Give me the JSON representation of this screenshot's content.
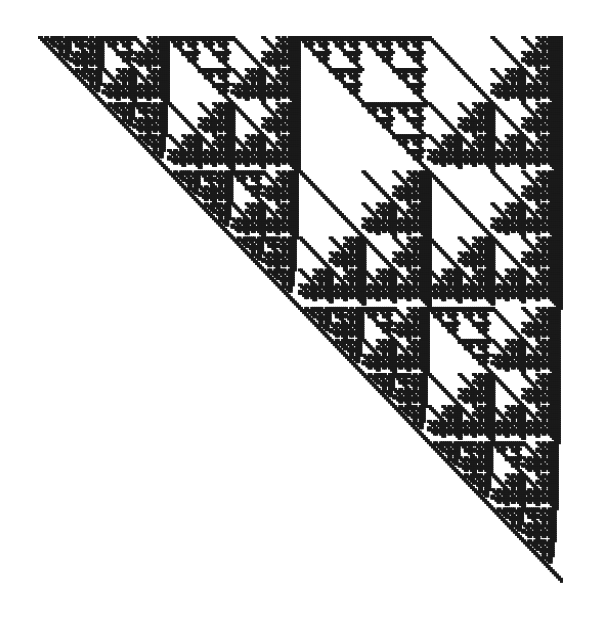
{
  "image": {
    "title": "Sierpinski-type recursive fractal",
    "width": 600,
    "height": 626,
    "background_color": "#ffffff",
    "ink_color": "#1a1a1a"
  },
  "figure": {
    "name": "recursive-anti-diagonal-sierpinski",
    "bounds_px": {
      "left": 38,
      "top": 36,
      "right": 562,
      "bottom": 582
    },
    "grid_cells": 256,
    "cell_size_px": 2.05,
    "recursion_depth": 8,
    "stroke_color": "#1a1a1a",
    "fill_color": "#1a1a1a",
    "orientation": "anti-diagonal (top-left to bottom-right)",
    "symmetry": "self-similar, scale factor 1/2 per level"
  },
  "chart_data": {
    "type": "scatter",
    "xlabel": "",
    "ylabel": "",
    "grid": false,
    "legend": null,
    "xlim": [
      0,
      256
    ],
    "ylim": [
      0,
      256
    ],
    "rule": "bitwise-xor-sierpinski",
    "iterations": 8,
    "point_color": "#1a1a1a",
    "point_size_px": 2,
    "annotations": []
  }
}
